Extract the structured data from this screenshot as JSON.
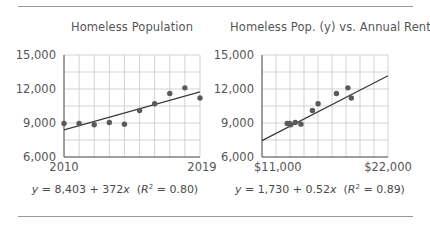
{
  "chart_data": [
    {
      "type": "scatter",
      "title": "Homeless Population",
      "xlabel": "",
      "ylabel": "",
      "x": [
        2010,
        2011,
        2012,
        2013,
        2014,
        2015,
        2016,
        2017,
        2018,
        2019
      ],
      "series": [
        {
          "name": "Homeless Population",
          "values": [
            8950,
            8950,
            8850,
            9050,
            8900,
            10100,
            10700,
            11600,
            12100,
            11200
          ]
        }
      ],
      "trendline": {
        "intercept": 8403,
        "slope": 372,
        "r2": 0.8,
        "x_origin": 2010
      },
      "xlim": [
        2010,
        2019
      ],
      "ylim": [
        6000,
        15000
      ],
      "xticks": [
        "2010",
        "2019"
      ],
      "yticks": [
        "6,000",
        "9,000",
        "12,000",
        "15,000"
      ],
      "grid": true,
      "annotation": "y = 8,403 + 372x (R² = 0.80)"
    },
    {
      "type": "scatter",
      "title": "Homeless Pop. (y) vs. Annual Rent (x)",
      "xlabel": "",
      "ylabel": "",
      "x": [
        13200,
        13400,
        13500,
        13900,
        14400,
        15400,
        15900,
        17500,
        18500,
        18800
      ],
      "series": [
        {
          "name": "Homeless Pop. vs Rent",
          "values": [
            8950,
            8950,
            8850,
            9050,
            8900,
            10100,
            10700,
            11600,
            12100,
            11200
          ]
        }
      ],
      "trendline": {
        "intercept": 1730,
        "slope": 0.52,
        "r2": 0.89
      },
      "xlim": [
        11000,
        22000
      ],
      "ylim": [
        6000,
        15000
      ],
      "xticks": [
        "$11,000",
        "$22,000"
      ],
      "yticks": [
        "6,000",
        "9,000",
        "12,000",
        "15,000"
      ],
      "grid": true,
      "annotation": "y = 1,730 + 0.52x (R² = 0.89)"
    }
  ],
  "left": {
    "title": "Homeless Population",
    "eq_y": "y",
    "eq_mid": " = 8,403 + 372",
    "eq_x": "x",
    "eq_open": "  (",
    "eq_R": "R",
    "eq_sup": "2",
    "eq_close": " = 0.80)"
  },
  "right": {
    "title": "Homeless Pop. (y) vs. Annual Rent (x)",
    "eq_y": "y",
    "eq_mid": " = 1,730 + 0.52",
    "eq_x": "x",
    "eq_open": "  (",
    "eq_R": "R",
    "eq_sup": "2",
    "eq_close": " = 0.89)"
  },
  "colors": {
    "grid": "#c8c8c8",
    "axis": "#555555",
    "point": "#5a5a5a",
    "line": "#3c3c3c",
    "rule": "#9a9a9a"
  }
}
